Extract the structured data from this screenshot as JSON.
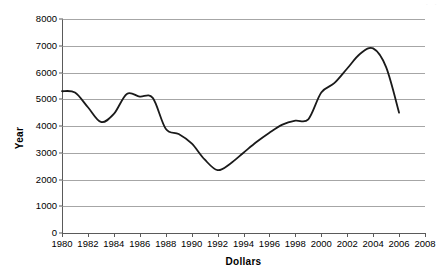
{
  "chart_data": {
    "type": "line",
    "title": "",
    "xlabel": "Dollars",
    "ylabel": "Year",
    "xlim": [
      1980,
      2008
    ],
    "ylim": [
      0,
      8000
    ],
    "ytick_step": 1000,
    "xtick_step": 2,
    "grid": "horizontal",
    "legend": "none",
    "line_color": "#1a1a1a",
    "gridline_color": "#a6a6a6",
    "axis_color": "#5a5a5a",
    "background": "#ffffff",
    "y_ticks": [
      "8000",
      "7000",
      "6000",
      "5000",
      "4000",
      "3000",
      "2000",
      "1000",
      "0"
    ],
    "y_tick_values": [
      8000,
      7000,
      6000,
      5000,
      4000,
      3000,
      2000,
      1000,
      0
    ],
    "x_ticks": [
      "1980",
      "1982",
      "1984",
      "1986",
      "1988",
      "1990",
      "1992",
      "1994",
      "1996",
      "1998",
      "2000",
      "2002",
      "2004",
      "2006",
      "2008"
    ],
    "x_tick_values": [
      1980,
      1982,
      1984,
      1986,
      1988,
      1990,
      1992,
      1994,
      1996,
      1998,
      2000,
      2002,
      2004,
      2006,
      2008
    ],
    "series": [
      {
        "name": "series-1",
        "x": [
          1980,
          1981,
          1982,
          1983,
          1984,
          1985,
          1986,
          1987,
          1988,
          1989,
          1990,
          1991,
          1992,
          1993,
          1994,
          1995,
          1996,
          1997,
          1998,
          1999,
          2000,
          2001,
          2002,
          2003,
          2004,
          2005,
          2006
        ],
        "values": [
          5300,
          5250,
          4700,
          4150,
          4450,
          5200,
          5100,
          5050,
          3900,
          3700,
          3350,
          2750,
          2350,
          2600,
          3000,
          3400,
          3750,
          4050,
          4200,
          4250,
          5250,
          5600,
          6150,
          6700,
          6900,
          6200,
          4500
        ]
      }
    ]
  },
  "annotations": {
    "top_right_artifact": "· ·"
  }
}
